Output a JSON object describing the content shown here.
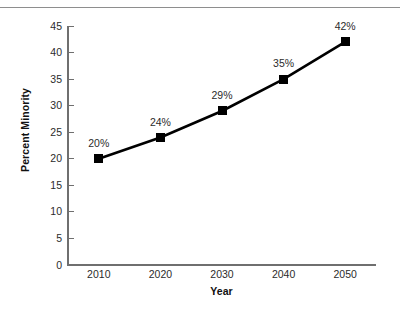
{
  "figure": {
    "background_color": "#ffffff",
    "axis_color": "#6f6f6f",
    "series_color": "#000000",
    "rule_color": "#8e8e8e"
  },
  "chart_data": {
    "type": "line",
    "title": "",
    "subtitle": "",
    "xlabel": "Year",
    "ylabel": "Percent Minority",
    "categories": [
      "2010",
      "2020",
      "2030",
      "2040",
      "2050"
    ],
    "x": [
      2010,
      2020,
      2030,
      2040,
      2050
    ],
    "values": [
      20,
      24,
      29,
      35,
      42
    ],
    "point_labels": [
      "20%",
      "24%",
      "29%",
      "35%",
      "42%"
    ],
    "xlim": [
      2005,
      2055
    ],
    "ylim": [
      0,
      45
    ],
    "yticks": [
      0,
      5,
      10,
      15,
      20,
      25,
      30,
      35,
      40,
      45
    ],
    "ytick_labels": [
      "0",
      "5",
      "10",
      "15",
      "20",
      "25",
      "30",
      "35",
      "40",
      "45"
    ],
    "xtick_labels": [
      "2010",
      "2020",
      "2030",
      "2040",
      "2050"
    ],
    "grid": false,
    "legend": false,
    "legend_position": "none",
    "marker": "square",
    "series": [
      {
        "name": "Percent Minority",
        "values": [
          20,
          24,
          29,
          35,
          42
        ]
      }
    ]
  }
}
